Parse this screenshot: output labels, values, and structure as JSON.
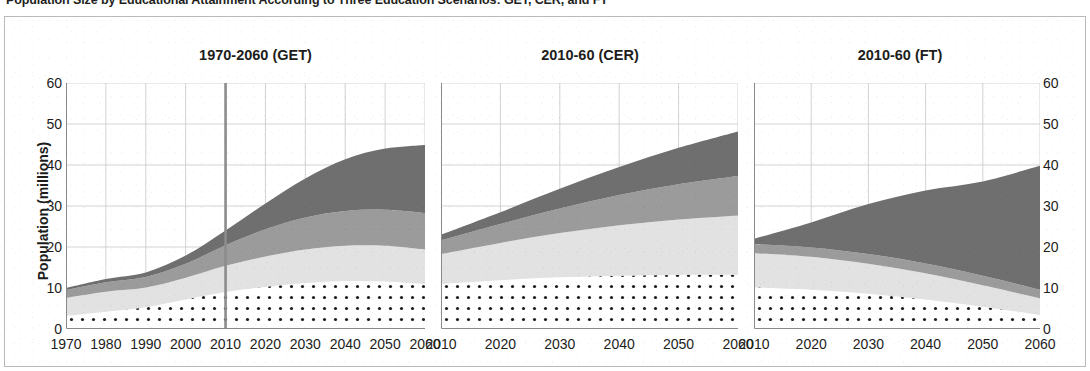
{
  "figure": {
    "title": "Population Size by Educational Attainment According to Three Education Scenarios: GET, CER, and FT",
    "y_axis_title": "Population (millions)",
    "frame_color": "#b9b9b9",
    "background": "#ffffff"
  },
  "axes": {
    "y_ticks": [
      "60",
      "50",
      "40",
      "30",
      "20",
      "10",
      "0"
    ],
    "y_values": [
      60,
      50,
      40,
      30,
      20,
      10,
      0
    ],
    "y_min": 0,
    "y_max": 60,
    "grid": true,
    "grid_color": "#c8c8c8"
  },
  "series_styles": {
    "no_education": {
      "name": "No education",
      "fill": "#ffffff",
      "pattern": "dots",
      "dot_color": "#1d1d1b"
    },
    "primary": {
      "name": "Primary",
      "fill": "#e2e2e2"
    },
    "secondary": {
      "name": "Secondary",
      "fill": "#9b9b9b"
    },
    "tertiary": {
      "name": "Tertiary",
      "fill": "#6f6f6f"
    }
  },
  "marker_line": {
    "year": 2010,
    "color": "#8c8c8c",
    "panel": 0
  },
  "chart_data": {
    "type": "area",
    "title": "Population Size by Educational Attainment According to Three Education Scenarios: GET, CER, and FT",
    "xlabel": "",
    "ylabel": "Population (millions)",
    "ylim": [
      0,
      60
    ],
    "stacked": true,
    "grid": true,
    "legend_position": "none",
    "panels": [
      {
        "label": "1970-2060 (GET)",
        "scenario": "GET",
        "x": [
          1970,
          1980,
          1990,
          2000,
          2010,
          2020,
          2030,
          2040,
          2050,
          2060
        ],
        "x_ticks": [
          "1970",
          "1980",
          "1990",
          "2000",
          "2010",
          "2020",
          "2030",
          "2040",
          "2050",
          "2060"
        ],
        "xlim": [
          1970,
          2060
        ],
        "series": [
          {
            "name": "No education",
            "values": [
              3.2,
              4.2,
              5.3,
              7.2,
              9.0,
              10.3,
              11.2,
              11.7,
              11.6,
              11.0
            ]
          },
          {
            "name": "Primary",
            "values": [
              4.4,
              4.9,
              4.8,
              5.3,
              6.4,
              7.4,
              8.2,
              8.6,
              8.7,
              8.4
            ]
          },
          {
            "name": "Secondary",
            "values": [
              1.9,
              2.3,
              2.6,
              3.4,
              5.0,
              6.6,
              7.8,
              8.5,
              8.8,
              8.9
            ]
          },
          {
            "name": "Tertiary",
            "values": [
              0.5,
              0.8,
              1.1,
              2.0,
              3.6,
              6.3,
              9.5,
              12.6,
              14.9,
              16.6
            ]
          }
        ],
        "totals": [
          10.0,
          12.2,
          13.8,
          17.9,
          24.0,
          30.6,
          36.7,
          41.4,
          44.0,
          44.9
        ]
      },
      {
        "label": "2010-60 (CER)",
        "scenario": "CER",
        "x": [
          2010,
          2020,
          2030,
          2040,
          2050,
          2060
        ],
        "x_ticks": [
          "2010",
          "2020",
          "2030",
          "2040",
          "2050",
          "2060"
        ],
        "xlim": [
          2010,
          2060
        ],
        "series": [
          {
            "name": "No education",
            "values": [
              11.0,
              11.9,
              12.6,
              13.0,
              13.2,
              13.2
            ]
          },
          {
            "name": "Primary",
            "values": [
              7.3,
              9.1,
              10.8,
              12.3,
              13.5,
              14.5
            ]
          },
          {
            "name": "Secondary",
            "values": [
              3.3,
              4.6,
              6.0,
              7.4,
              8.6,
              9.6
            ]
          },
          {
            "name": "Tertiary",
            "values": [
              1.4,
              2.9,
              4.8,
              6.8,
              8.9,
              10.9
            ]
          }
        ],
        "totals": [
          23.0,
          28.5,
          34.2,
          39.5,
          44.2,
          48.2
        ]
      },
      {
        "label": "2010-60 (FT)",
        "scenario": "FT",
        "x": [
          2010,
          2020,
          2030,
          2040,
          2050,
          2060
        ],
        "x_ticks": [
          "2010",
          "2020",
          "2030",
          "2040",
          "2050",
          "2060"
        ],
        "xlim": [
          2010,
          2060
        ],
        "series": [
          {
            "name": "No education",
            "values": [
              10.2,
              9.6,
              8.6,
              7.2,
              5.4,
              3.4
            ]
          },
          {
            "name": "Primary",
            "values": [
              8.3,
              8.0,
              7.3,
              6.4,
              5.3,
              4.1
            ]
          },
          {
            "name": "Secondary",
            "values": [
              2.2,
              2.3,
              2.4,
              2.4,
              2.3,
              2.1
            ]
          },
          {
            "name": "Tertiary",
            "values": [
              1.3,
              6.1,
              12.2,
              17.8,
              23.0,
              30.2
            ]
          }
        ],
        "totals": [
          22.0,
          26.0,
          30.5,
          33.8,
          36.0,
          39.8
        ]
      }
    ]
  }
}
